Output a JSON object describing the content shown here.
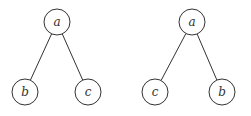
{
  "trees": [
    {
      "name": "left-tree",
      "nodes": [
        {
          "id": "a",
          "label": "a",
          "x": 57,
          "y": 22
        },
        {
          "id": "b",
          "label": "b",
          "x": 25,
          "y": 92
        },
        {
          "id": "c",
          "label": "c",
          "x": 88,
          "y": 92
        }
      ],
      "edges": [
        [
          "a",
          "b"
        ],
        [
          "a",
          "c"
        ]
      ]
    },
    {
      "name": "right-tree",
      "nodes": [
        {
          "id": "a",
          "label": "a",
          "x": 192,
          "y": 22
        },
        {
          "id": "c",
          "label": "c",
          "x": 155,
          "y": 92
        },
        {
          "id": "b",
          "label": "b",
          "x": 222,
          "y": 92
        }
      ],
      "edges": [
        [
          "a",
          "c"
        ],
        [
          "a",
          "b"
        ]
      ]
    }
  ],
  "style": {
    "stroke": "#333333",
    "background": "#ffffff",
    "radius": 13
  }
}
